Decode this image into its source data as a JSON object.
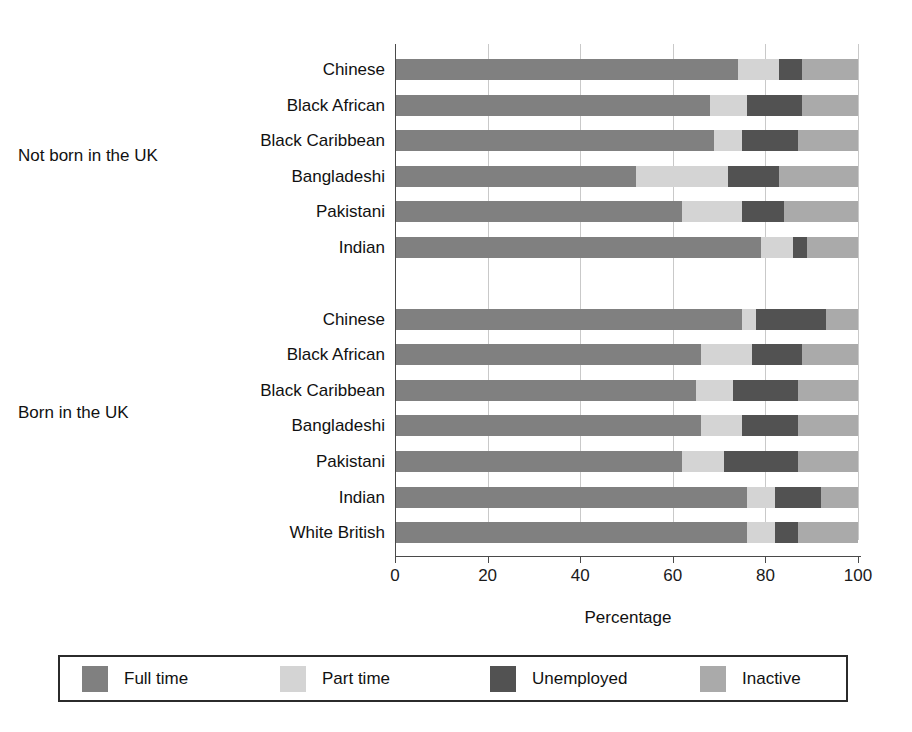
{
  "chart_data": {
    "type": "bar",
    "orientation": "horizontal",
    "stacked": true,
    "title": "",
    "xlabel": "Percentage",
    "ylabel": "",
    "xlim": [
      0,
      100
    ],
    "xticks": [
      0,
      20,
      40,
      60,
      80,
      100
    ],
    "grid": true,
    "legend_position": "bottom",
    "series": [
      {
        "name": "Full time",
        "color": "#808080"
      },
      {
        "name": "Part time",
        "color": "#d4d4d4"
      },
      {
        "name": "Unemployed",
        "color": "#525252"
      },
      {
        "name": "Inactive",
        "color": "#aaaaaa"
      }
    ],
    "groups": [
      {
        "label": "Not born in the UK",
        "categories": [
          "Chinese",
          "Black African",
          "Black Caribbean",
          "Bangladeshi",
          "Pakistani",
          "Indian"
        ],
        "values": [
          {
            "category": "Chinese",
            "Full time": 74,
            "Part time": 9,
            "Unemployed": 5,
            "Inactive": 12
          },
          {
            "category": "Black African",
            "Full time": 68,
            "Part time": 8,
            "Unemployed": 12,
            "Inactive": 12
          },
          {
            "category": "Black Caribbean",
            "Full time": 69,
            "Part time": 6,
            "Unemployed": 12,
            "Inactive": 13
          },
          {
            "category": "Bangladeshi",
            "Full time": 52,
            "Part time": 20,
            "Unemployed": 11,
            "Inactive": 17
          },
          {
            "category": "Pakistani",
            "Full time": 62,
            "Part time": 13,
            "Unemployed": 9,
            "Inactive": 16
          },
          {
            "category": "Indian",
            "Full time": 79,
            "Part time": 7,
            "Unemployed": 3,
            "Inactive": 11
          }
        ]
      },
      {
        "label": "Born in the UK",
        "categories": [
          "Chinese",
          "Black African",
          "Black Caribbean",
          "Bangladeshi",
          "Pakistani",
          "Indian",
          "White British"
        ],
        "values": [
          {
            "category": "Chinese",
            "Full time": 75,
            "Part time": 3,
            "Unemployed": 15,
            "Inactive": 7
          },
          {
            "category": "Black African",
            "Full time": 66,
            "Part time": 11,
            "Unemployed": 11,
            "Inactive": 12
          },
          {
            "category": "Black Caribbean",
            "Full time": 65,
            "Part time": 8,
            "Unemployed": 14,
            "Inactive": 13
          },
          {
            "category": "Bangladeshi",
            "Full time": 66,
            "Part time": 9,
            "Unemployed": 12,
            "Inactive": 13
          },
          {
            "category": "Pakistani",
            "Full time": 62,
            "Part time": 9,
            "Unemployed": 16,
            "Inactive": 13
          },
          {
            "category": "Indian",
            "Full time": 76,
            "Part time": 6,
            "Unemployed": 10,
            "Inactive": 8
          },
          {
            "category": "White British",
            "Full time": 76,
            "Part time": 6,
            "Unemployed": 5,
            "Inactive": 13
          }
        ]
      }
    ]
  },
  "axis": {
    "xlabel": "Percentage",
    "tick_labels": [
      "0",
      "20",
      "40",
      "60",
      "80",
      "100"
    ]
  },
  "legend": {
    "items": [
      {
        "label": "Full time",
        "color": "#808080"
      },
      {
        "label": "Part time",
        "color": "#d4d4d4"
      },
      {
        "label": "Unemployed",
        "color": "#525252"
      },
      {
        "label": "Inactive",
        "color": "#aaaaaa"
      }
    ]
  }
}
